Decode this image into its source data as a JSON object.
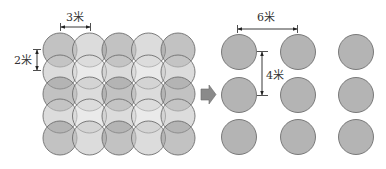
{
  "diagram": {
    "left_panel": {
      "description": "Dense overlapping grid of circles",
      "rows": 5,
      "cols": 5,
      "horizontal_spacing_label": "3米",
      "vertical_spacing_label": "2米",
      "circle_diameter_px": 34,
      "dx_px": 29.5,
      "dy_px": 22,
      "origin_px": [
        60,
        50
      ],
      "dark_color": "#9a9a9a",
      "light_color": "#dcdcdc",
      "stroke_color": "#6e6e6e"
    },
    "arrow": {
      "direction": "right",
      "color": "#8a8a8a"
    },
    "right_panel": {
      "description": "Sparse grid of non-overlapping circles",
      "rows": 3,
      "cols": 3,
      "horizontal_spacing_label": "6米",
      "vertical_spacing_label": "4米",
      "circle_diameter_px": 35,
      "col_centers_px": [
        239,
        298,
        356
      ],
      "row_centers_px": [
        52,
        95,
        137
      ],
      "fill_color": "#b4b4b4",
      "stroke_color": "#6e6e6e"
    },
    "labels": {
      "three_m": "3米",
      "two_m": "2米",
      "six_m": "6米",
      "four_m": "4米"
    }
  }
}
